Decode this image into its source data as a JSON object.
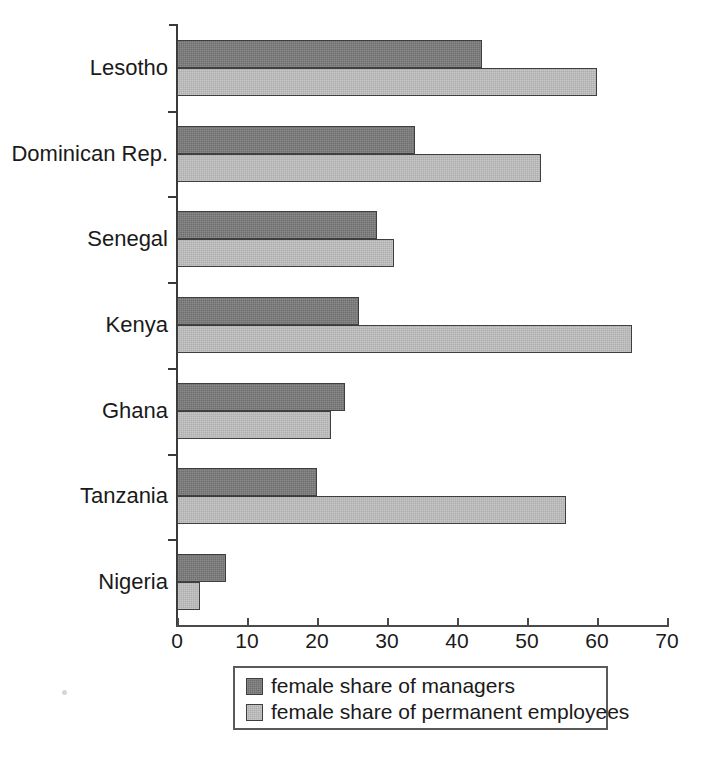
{
  "chart_data": {
    "type": "bar",
    "orientation": "horizontal",
    "title": "",
    "subtitle": "",
    "xlabel": "",
    "ylabel": "",
    "xlim": [
      0,
      70
    ],
    "xticks": [
      0,
      10,
      20,
      30,
      40,
      50,
      60,
      70
    ],
    "xtick_labels": [
      "0",
      "10",
      "20",
      "30",
      "40",
      "50",
      "60",
      "70"
    ],
    "grid": false,
    "legend_position": "bottom-center",
    "categories": [
      "Lesotho",
      "Dominican Rep.",
      "Senegal",
      "Kenya",
      "Ghana",
      "Tanzania",
      "Nigeria"
    ],
    "series": [
      {
        "name": "female share of managers",
        "key": "managers",
        "color": "#6e6e6e",
        "values": [
          43.5,
          34,
          28.5,
          26,
          24,
          20,
          7
        ]
      },
      {
        "name": "female share of permanent employees",
        "key": "permanent",
        "color": "#aeaeae",
        "values": [
          60,
          52,
          31,
          65,
          22,
          55.5,
          3.3
        ]
      }
    ]
  },
  "legend": {
    "items": [
      {
        "label": "female share of managers",
        "series_key": "managers"
      },
      {
        "label": "female share of permanent employees",
        "series_key": "permanent"
      }
    ]
  },
  "colors": {
    "managers": "#6e6e6e",
    "permanent": "#aeaeae",
    "axis": "#3a3a3a",
    "text": "#1a1a1a",
    "background": "#ffffff"
  }
}
